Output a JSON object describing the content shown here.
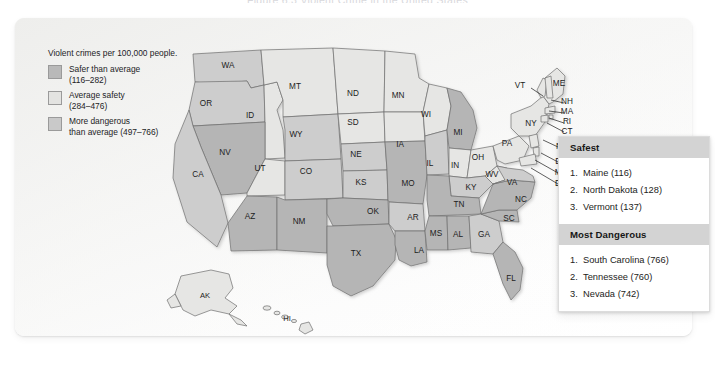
{
  "figure": {
    "title": "Figure 6.3  Violent Crime in the United States"
  },
  "legend": {
    "title": "Violent crimes per 100,000 people.",
    "items": [
      {
        "label": "Safer than average",
        "range": "(116–282)",
        "color": "#b9b9b9",
        "key": "safer"
      },
      {
        "label": "Average safety",
        "range": "(284–476)",
        "color": "#e3e3e1",
        "key": "average"
      },
      {
        "label": "More dangerous",
        "range": "than average (497–766)",
        "color": "#c9c9c9",
        "key": "dangerous"
      }
    ]
  },
  "ranking": {
    "safest": {
      "heading": "Safest",
      "items": [
        {
          "rank": "1.",
          "text": "Maine (116)"
        },
        {
          "rank": "2.",
          "text": "North Dakota (128)"
        },
        {
          "rank": "3.",
          "text": "Vermont (137)"
        }
      ]
    },
    "most_dangerous": {
      "heading": "Most Dangerous",
      "items": [
        {
          "rank": "1.",
          "text": "South Carolina (766)"
        },
        {
          "rank": "2.",
          "text": "Tennessee (760)"
        },
        {
          "rank": "3.",
          "text": "Nevada (742)"
        }
      ]
    }
  },
  "map": {
    "inline_labels": [
      {
        "id": "WA",
        "x": 213,
        "y": 50,
        "tone": "mid"
      },
      {
        "id": "OR",
        "x": 191,
        "y": 88,
        "tone": "mid"
      },
      {
        "id": "ID",
        "x": 235,
        "y": 100,
        "tone": "light"
      },
      {
        "id": "MT",
        "x": 280,
        "y": 71,
        "tone": "light"
      },
      {
        "id": "WY",
        "x": 281,
        "y": 119,
        "tone": "mid"
      },
      {
        "id": "NV",
        "x": 210,
        "y": 137,
        "tone": "dark"
      },
      {
        "id": "UT",
        "x": 245,
        "y": 153,
        "tone": "light"
      },
      {
        "id": "CO",
        "x": 291,
        "y": 156,
        "tone": "mid"
      },
      {
        "id": "CA",
        "x": 183,
        "y": 159,
        "tone": "mid"
      },
      {
        "id": "AZ",
        "x": 235,
        "y": 201,
        "tone": "dark"
      },
      {
        "id": "NM",
        "x": 284,
        "y": 206,
        "tone": "dark"
      },
      {
        "id": "ND",
        "x": 338,
        "y": 78,
        "tone": "light"
      },
      {
        "id": "SD",
        "x": 338,
        "y": 107,
        "tone": "light"
      },
      {
        "id": "NE",
        "x": 341,
        "y": 139,
        "tone": "mid"
      },
      {
        "id": "KS",
        "x": 346,
        "y": 167,
        "tone": "mid"
      },
      {
        "id": "OK",
        "x": 358,
        "y": 196,
        "tone": "dark"
      },
      {
        "id": "TX",
        "x": 341,
        "y": 238,
        "tone": "dark"
      },
      {
        "id": "MN",
        "x": 383,
        "y": 80,
        "tone": "light"
      },
      {
        "id": "IA",
        "x": 385,
        "y": 129,
        "tone": "light"
      },
      {
        "id": "MO",
        "x": 393,
        "y": 168,
        "tone": "dark"
      },
      {
        "id": "AR",
        "x": 398,
        "y": 202,
        "tone": "mid"
      },
      {
        "id": "LA",
        "x": 404,
        "y": 235,
        "tone": "dark"
      },
      {
        "id": "WI",
        "x": 411,
        "y": 99,
        "tone": "light"
      },
      {
        "id": "IL",
        "x": 415,
        "y": 148,
        "tone": "mid"
      },
      {
        "id": "MI",
        "x": 443,
        "y": 117,
        "tone": "dark"
      },
      {
        "id": "IN",
        "x": 440,
        "y": 150,
        "tone": "light"
      },
      {
        "id": "OH",
        "x": 463,
        "y": 142,
        "tone": "light"
      },
      {
        "id": "KY",
        "x": 456,
        "y": 172,
        "tone": "mid"
      },
      {
        "id": "TN",
        "x": 444,
        "y": 189,
        "tone": "dark"
      },
      {
        "id": "MS",
        "x": 421,
        "y": 218,
        "tone": "dark"
      },
      {
        "id": "AL",
        "x": 443,
        "y": 219,
        "tone": "dark"
      },
      {
        "id": "GA",
        "x": 469,
        "y": 219,
        "tone": "mid"
      },
      {
        "id": "FL",
        "x": 496,
        "y": 263,
        "tone": "dark"
      },
      {
        "id": "SC",
        "x": 494,
        "y": 203,
        "tone": "dark"
      },
      {
        "id": "NC",
        "x": 506,
        "y": 184,
        "tone": "dark"
      },
      {
        "id": "WV",
        "x": 477,
        "y": 159,
        "tone": "light"
      },
      {
        "id": "VA",
        "x": 497,
        "y": 167,
        "tone": "mid"
      },
      {
        "id": "PA",
        "x": 492,
        "y": 128,
        "tone": "light"
      },
      {
        "id": "NY",
        "x": 516,
        "y": 108,
        "tone": "light"
      },
      {
        "id": "ME",
        "x": 544,
        "y": 68,
        "tone": "light"
      }
    ],
    "callout_labels": [
      {
        "id": "VT",
        "x": 505,
        "y": 70,
        "lx1": 516,
        "ly1": 70,
        "lx2": 528,
        "ly2": 78
      },
      {
        "id": "NH",
        "x": 552,
        "y": 86,
        "lx1": 549,
        "ly1": 85,
        "lx2": 536,
        "ly2": 82
      },
      {
        "id": "MA",
        "x": 552,
        "y": 96,
        "lx1": 549,
        "ly1": 95,
        "lx2": 534,
        "ly2": 93
      },
      {
        "id": "RI",
        "x": 552,
        "y": 106,
        "lx1": 549,
        "ly1": 105,
        "lx2": 534,
        "ly2": 100
      },
      {
        "id": "CT",
        "x": 552,
        "y": 116,
        "lx1": 549,
        "ly1": 114,
        "lx2": 532,
        "ly2": 105
      },
      {
        "id": "NJ",
        "x": 546,
        "y": 131,
        "lx1": 543,
        "ly1": 129,
        "lx2": 528,
        "ly2": 122
      },
      {
        "id": "DE",
        "x": 546,
        "y": 146,
        "lx1": 543,
        "ly1": 144,
        "lx2": 526,
        "ly2": 135
      },
      {
        "id": "MD",
        "x": 546,
        "y": 157,
        "lx1": 543,
        "ly1": 155,
        "lx2": 520,
        "ly2": 142
      },
      {
        "id": "DC",
        "x": 546,
        "y": 168,
        "lx1": 543,
        "ly1": 166,
        "lx2": 516,
        "ly2": 150
      }
    ],
    "inset_labels": [
      {
        "id": "AK",
        "x": 190,
        "y": 280
      },
      {
        "id": "HI",
        "x": 272,
        "y": 303
      }
    ]
  }
}
